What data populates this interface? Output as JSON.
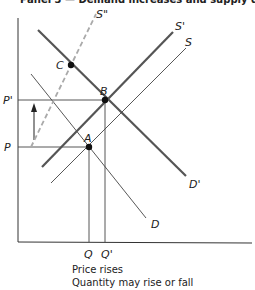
{
  "title": "Panel 3 — Demand increases and supply decreases",
  "axes": {
    "y_labels": [
      "P'",
      "P"
    ],
    "x_labels": [
      "Q",
      "Q'"
    ]
  },
  "curves": {
    "demand_original": "D",
    "demand_new": "D'",
    "supply_original": "S",
    "supply_new": "S'",
    "supply_alt": "S\""
  },
  "points": [
    "A",
    "B",
    "C"
  ],
  "caption": {
    "line1": "Price rises",
    "line2": "Quantity may rise or fall"
  },
  "colors": {
    "thick_line": "#555555",
    "thin_line": "#444444",
    "dashed_line": "#aaaaaa",
    "axis": "#333333"
  }
}
